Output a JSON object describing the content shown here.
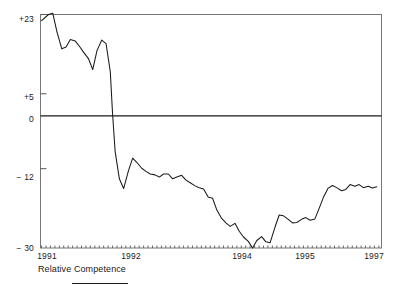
{
  "figure": {
    "caption": "Relative Competence",
    "legend_series_label": "Relative Competence",
    "line_color": "#1a1a1a",
    "frame_color": "#6b6b6b",
    "background": "#ffffff"
  },
  "axes": {
    "y_tick_labels": [
      "+23",
      "+5",
      "0",
      "− 12",
      "− 30"
    ],
    "y_tick_values": [
      23,
      5,
      0,
      -12,
      -30
    ],
    "x_tick_labels": [
      "1991",
      "1992",
      "1994",
      "1995",
      "1997"
    ],
    "x_tick_values": [
      1991,
      1992,
      1994,
      1995,
      1997
    ]
  },
  "chart_data": {
    "type": "line",
    "title": "",
    "subtitle": "",
    "xlabel": "",
    "ylabel": "",
    "caption": "Relative Competence",
    "grid": false,
    "legend_position": "below-left",
    "zero_line": 0,
    "xlim": [
      1990.85,
      1997.25
    ],
    "ylim": [
      -30,
      23
    ],
    "y_ticks": [
      23,
      5,
      0,
      -12,
      -30
    ],
    "y_tick_labels": [
      "+23",
      "+5",
      "0",
      "− 12",
      "− 30"
    ],
    "x_ticks": [
      1991,
      1992,
      1994,
      1995,
      1997
    ],
    "x_tick_labels": [
      "1991",
      "1992",
      "1994",
      "1995",
      "1997"
    ],
    "x_minor_tick_interval": 0.0833,
    "series": [
      {
        "name": "Relative Competence",
        "color": "#1a1a1a",
        "x": [
          1990.87,
          1991.0,
          1991.08,
          1991.16,
          1991.25,
          1991.33,
          1991.41,
          1991.5,
          1991.58,
          1991.66,
          1991.75,
          1991.83,
          1991.91,
          1992.0,
          1992.08,
          1992.16,
          1992.2,
          1992.25,
          1992.33,
          1992.41,
          1992.5,
          1992.58,
          1992.66,
          1992.75,
          1992.83,
          1992.91,
          1993.0,
          1993.08,
          1993.16,
          1993.25,
          1993.33,
          1993.41,
          1993.5,
          1993.58,
          1993.66,
          1993.75,
          1993.83,
          1993.91,
          1994.0,
          1994.08,
          1994.16,
          1994.25,
          1994.33,
          1994.41,
          1994.5,
          1994.58,
          1994.66,
          1994.75,
          1994.83,
          1994.91,
          1995.0,
          1995.08,
          1995.16,
          1995.25,
          1995.33,
          1995.41,
          1995.5,
          1995.58,
          1995.66,
          1995.75,
          1995.83,
          1995.91,
          1996.0,
          1996.08,
          1996.16,
          1996.25,
          1996.33,
          1996.41,
          1996.5,
          1996.58,
          1996.66,
          1996.75,
          1996.83,
          1996.91,
          1997.0,
          1997.08,
          1997.16
        ],
        "y": [
          21.6,
          23.0,
          23.3,
          19.0,
          15.2,
          15.6,
          17.3,
          17.0,
          15.8,
          14.4,
          13.0,
          10.5,
          14.8,
          17.2,
          16.4,
          10.0,
          1.0,
          -8.0,
          -14.3,
          -16.5,
          -12.5,
          -9.6,
          -10.6,
          -11.9,
          -12.6,
          -13.2,
          -13.4,
          -13.9,
          -13.2,
          -13.2,
          -14.3,
          -13.9,
          -13.5,
          -14.6,
          -15.2,
          -15.9,
          -16.3,
          -16.6,
          -18.5,
          -18.7,
          -21.4,
          -23.3,
          -24.3,
          -25.1,
          -24.4,
          -26.2,
          -27.5,
          -28.5,
          -30.0,
          -28.3,
          -27.4,
          -28.6,
          -28.8,
          -25.3,
          -22.5,
          -22.7,
          -23.5,
          -24.3,
          -24.2,
          -23.5,
          -23.1,
          -23.7,
          -23.4,
          -21.0,
          -18.5,
          -16.4,
          -15.8,
          -16.3,
          -17.0,
          -16.7,
          -15.6,
          -16.0,
          -15.6,
          -16.3,
          -16.0,
          -16.4,
          -16.1
        ]
      }
    ]
  }
}
